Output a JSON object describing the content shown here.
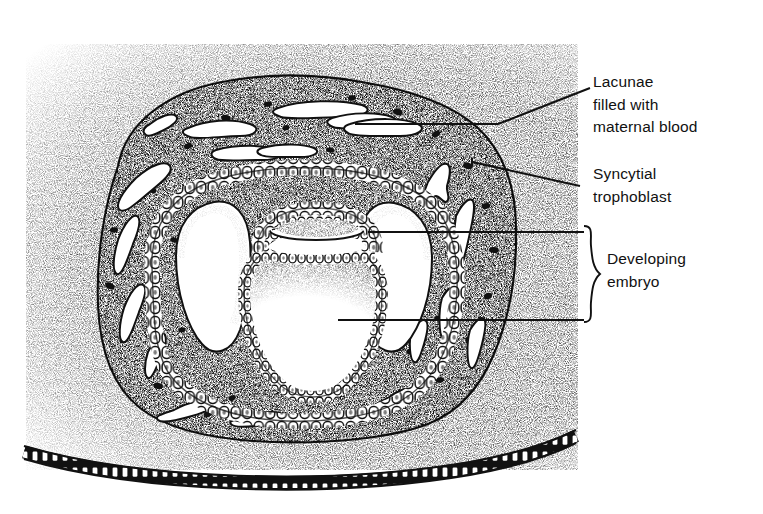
{
  "figure": {
    "type": "biological-illustration",
    "style": "pen-and-ink stipple drawing",
    "ink_color": "#111111",
    "background_color": "#ffffff"
  },
  "labels": [
    {
      "id": "lacunae",
      "text": "Lacunae\nfilled with\nmaternal blood",
      "lines": [
        "Lacunae",
        "filled with",
        "maternal blood"
      ],
      "leader": "elbow",
      "points_to": "white irregular cavity in syncytiotrophoblast"
    },
    {
      "id": "syncytial",
      "text": "Syncytial\ntrophoblast",
      "lines": [
        "Syncytial",
        "trophoblast"
      ],
      "leader": "diagonal",
      "points_to": "stippled outer trophoblast mass"
    },
    {
      "id": "embryo",
      "text": "Developing\nembryo",
      "lines": [
        "Developing",
        "embryo"
      ],
      "leader": "bracket-with-two-lines",
      "points_to": "bilaminar embryonic disc and yolk sac"
    }
  ],
  "structures": [
    {
      "name": "syncytiotrophoblast",
      "appearance": "dense stipple with dark flecks"
    },
    {
      "name": "lacunae",
      "appearance": "white irregular blood-filled spaces"
    },
    {
      "name": "cytotrophoblast",
      "appearance": "single layer of rounded cells"
    },
    {
      "name": "amniotic-cavity",
      "appearance": "small space above embryonic disc"
    },
    {
      "name": "bilaminar-embryonic-disc",
      "appearance": "two-layered plate of columnar cells"
    },
    {
      "name": "yolk-sac-cavity",
      "appearance": "large rounded cavity below disc"
    },
    {
      "name": "uterine-epithelium",
      "appearance": "dark band with regular cell outlines at base"
    },
    {
      "name": "endometrial-stroma",
      "appearance": "graded stipple field"
    }
  ]
}
